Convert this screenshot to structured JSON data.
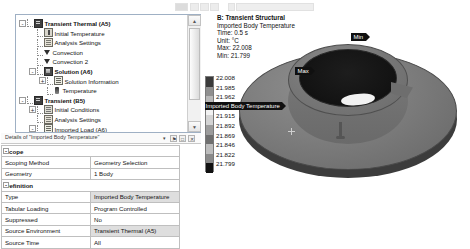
{
  "tree": {
    "nodes": [
      {
        "label": "Transient Thermal (A5)",
        "depth": 0,
        "bold": true,
        "exp": "-",
        "icon": "grid-icon"
      },
      {
        "label": "Initial Temperature",
        "depth": 1,
        "bold": false,
        "exp": "",
        "icon": "thermometer-icon"
      },
      {
        "label": "Analysis Settings",
        "depth": 1,
        "bold": false,
        "exp": "",
        "icon": "settings-sheet-icon"
      },
      {
        "label": "Convection",
        "depth": 1,
        "bold": false,
        "exp": "",
        "icon": "convection-icon"
      },
      {
        "label": "Convection 2",
        "depth": 1,
        "bold": false,
        "exp": "",
        "icon": "convection-icon"
      },
      {
        "label": "Solution (A6)",
        "depth": 1,
        "bold": true,
        "exp": "-",
        "icon": "solution-icon"
      },
      {
        "label": "Solution Information",
        "depth": 2,
        "bold": false,
        "exp": "+",
        "icon": "info-sheet-icon"
      },
      {
        "label": "Temperature",
        "depth": 2,
        "bold": false,
        "exp": "",
        "icon": "temperature-result-icon"
      },
      {
        "label": "Transient (B5)",
        "depth": 0,
        "bold": true,
        "exp": "-",
        "icon": "grid-icon"
      },
      {
        "label": "Initial Conditions",
        "depth": 1,
        "bold": false,
        "exp": "+",
        "icon": "conditions-icon"
      },
      {
        "label": "Analysis Settings",
        "depth": 1,
        "bold": false,
        "exp": "",
        "icon": "settings-sheet-icon"
      },
      {
        "label": "Imported Load (A6)",
        "depth": 1,
        "bold": false,
        "exp": "-",
        "icon": "imported-load-icon"
      },
      {
        "label": "Imported Body Temperature",
        "depth": 2,
        "bold": false,
        "exp": "",
        "icon": "imported-body-temperature-icon"
      },
      {
        "label": "Solution (B6)",
        "depth": 1,
        "bold": true,
        "exp": "-",
        "icon": "solution-icon"
      }
    ],
    "scroll_up": "▲",
    "scroll_down": "▼"
  },
  "details": {
    "title": "Details of \"Imported Body Temperature\"",
    "controls": {
      "dropdown": "▾",
      "pin": "⚑",
      "maximize": "□",
      "close": "✕"
    },
    "sections": [
      {
        "name": "Scope",
        "exp": "-",
        "rows": [
          {
            "key": "Scoping Method",
            "value": "Geometry Selection",
            "highlight": false
          },
          {
            "key": "Geometry",
            "value": "1 Body",
            "highlight": false
          }
        ]
      },
      {
        "name": "Definition",
        "exp": "-",
        "rows": [
          {
            "key": "Type",
            "value": "Imported Body Temperature",
            "highlight": true
          },
          {
            "key": "Tabular Loading",
            "value": "Program Controlled",
            "highlight": false
          },
          {
            "key": "Suppressed",
            "value": "No",
            "highlight": false
          },
          {
            "key": "Source Environment",
            "value": "Transient Thermal (A5)",
            "highlight": true
          },
          {
            "key": "Source Time",
            "value": "All",
            "highlight": false
          }
        ]
      }
    ]
  },
  "viewport": {
    "header": {
      "system": "B: Transient Structural",
      "result": "Imported Body Temperature",
      "time": "Time: 0.5 s",
      "unit": "Unit: °C",
      "max": "Max: 22.008",
      "min": "Min: 21.799"
    },
    "annotations": {
      "min_tag": "Min",
      "max_tag": "Max",
      "body_tag": "Imported Body Temperature"
    }
  },
  "chart_data": {
    "type": "heatmap",
    "title": "Imported Body Temperature",
    "subtitle": "B: Transient Structural",
    "unit": "°C",
    "time_s": 0.5,
    "max": 22.008,
    "min": 21.799,
    "legend_position": "left",
    "legend_labels": [
      "22.008",
      "21.985",
      "21.962",
      "21.939",
      "21.915",
      "21.892",
      "21.869",
      "21.846",
      "21.822",
      "21.799"
    ],
    "legend_values": [
      22.008,
      21.985,
      21.962,
      21.939,
      21.915,
      21.892,
      21.869,
      21.846,
      21.822,
      21.799
    ],
    "legend_colors": [
      "#3a3a3a",
      "#8f8f8f",
      "#b8b8b8",
      "#f2f2f2",
      "#d4d4d4",
      "#9c9c9c",
      "#6f6f6f",
      "#bdbdbd",
      "#8a8a8a",
      "#111111"
    ]
  }
}
